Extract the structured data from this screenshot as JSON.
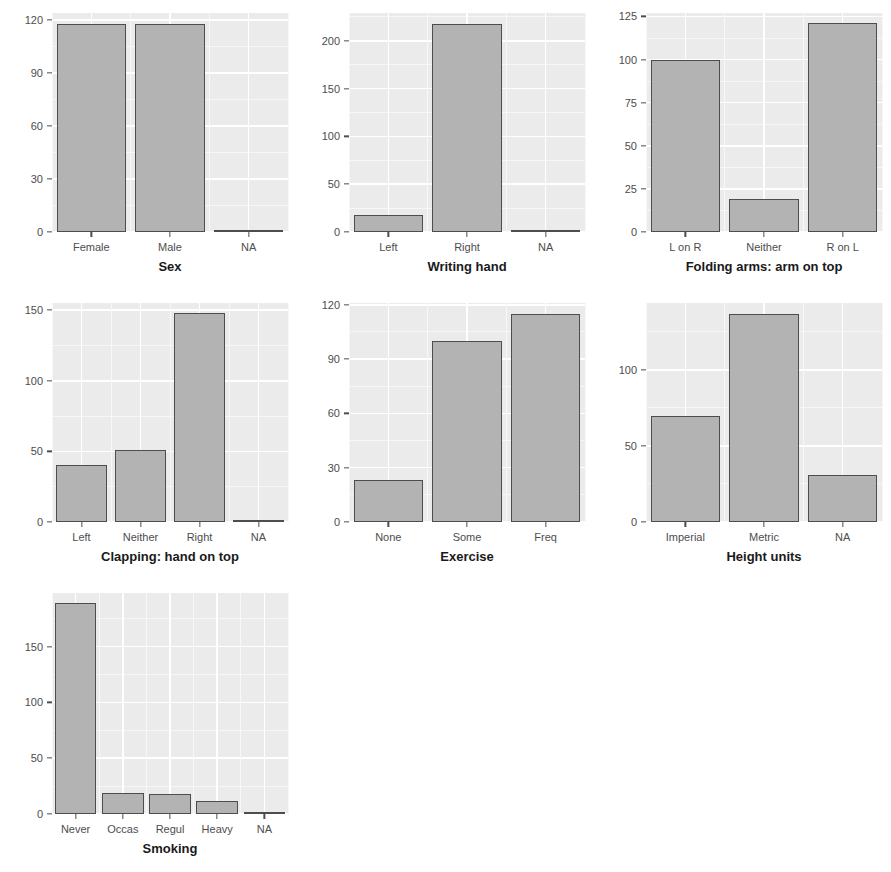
{
  "figure": {
    "background": "#ffffff",
    "panel_background": "#ebebeb",
    "grid_color": "#ffffff",
    "bar_fill": "#b3b3b3",
    "bar_stroke": "#4d4d4d",
    "axis_text_color": "#4d4d4d",
    "axis_title_color": "#1a1a1a"
  },
  "chart_data": [
    {
      "id": "sex",
      "type": "bar",
      "title": "",
      "xlabel": "Sex",
      "ylabel": "",
      "categories": [
        "Female",
        "Male",
        "NA"
      ],
      "values": [
        118,
        118,
        1
      ],
      "ylim": [
        0,
        124
      ],
      "yticks": [
        0,
        30,
        60,
        90,
        120
      ],
      "ytick_labels": [
        "0",
        "30",
        "60",
        "90",
        "120"
      ],
      "grid": true,
      "legend": "none"
    },
    {
      "id": "writing-hand",
      "type": "bar",
      "title": "",
      "xlabel": "Writing hand",
      "ylabel": "",
      "categories": [
        "Left",
        "Right",
        "NA"
      ],
      "values": [
        18,
        218,
        1
      ],
      "ylim": [
        0,
        229
      ],
      "yticks": [
        0,
        50,
        100,
        150,
        200
      ],
      "ytick_labels": [
        "0",
        "50",
        "100",
        "150",
        "200"
      ],
      "grid": true,
      "legend": "none"
    },
    {
      "id": "folding-arms",
      "type": "bar",
      "title": "",
      "xlabel": "Folding arms: arm on top",
      "ylabel": "",
      "categories": [
        "L on R",
        "Neither",
        "R on L"
      ],
      "values": [
        100,
        19,
        121
      ],
      "ylim": [
        0,
        127
      ],
      "yticks": [
        0,
        25,
        50,
        75,
        100,
        125
      ],
      "ytick_labels": [
        "0",
        "25",
        "50",
        "75",
        "100",
        "125"
      ],
      "grid": true,
      "legend": "none"
    },
    {
      "id": "clapping",
      "type": "bar",
      "title": "",
      "xlabel": "Clapping: hand on top",
      "ylabel": "",
      "categories": [
        "Left",
        "Neither",
        "Right",
        "NA"
      ],
      "values": [
        40,
        51,
        148,
        1
      ],
      "ylim": [
        0,
        155
      ],
      "yticks": [
        0,
        50,
        100,
        150
      ],
      "ytick_labels": [
        "0",
        "50",
        "100",
        "150"
      ],
      "grid": true,
      "legend": "none"
    },
    {
      "id": "exercise",
      "type": "bar",
      "title": "",
      "xlabel": "Exercise",
      "ylabel": "",
      "categories": [
        "None",
        "Some",
        "Freq"
      ],
      "values": [
        23,
        100,
        115
      ],
      "ylim": [
        0,
        121
      ],
      "yticks": [
        0,
        30,
        60,
        90,
        120
      ],
      "ytick_labels": [
        "0",
        "30",
        "60",
        "90",
        "120"
      ],
      "grid": true,
      "legend": "none"
    },
    {
      "id": "height-units",
      "type": "bar",
      "title": "",
      "xlabel": "Height units",
      "ylabel": "",
      "categories": [
        "Imperial",
        "Metric",
        "NA"
      ],
      "values": [
        70,
        137,
        31
      ],
      "ylim": [
        0,
        144
      ],
      "yticks": [
        0,
        50,
        100
      ],
      "ytick_labels": [
        "0",
        "50",
        "100"
      ],
      "grid": true,
      "legend": "none"
    },
    {
      "id": "smoking",
      "type": "bar",
      "title": "",
      "xlabel": "Smoking",
      "ylabel": "",
      "categories": [
        "Never",
        "Occas",
        "Regul",
        "Heavy",
        "NA"
      ],
      "values": [
        189,
        19,
        18,
        12,
        1
      ],
      "ylim": [
        0,
        198
      ],
      "yticks": [
        0,
        50,
        100,
        150
      ],
      "ytick_labels": [
        "0",
        "50",
        "100",
        "150"
      ],
      "grid": true,
      "legend": "none"
    }
  ]
}
